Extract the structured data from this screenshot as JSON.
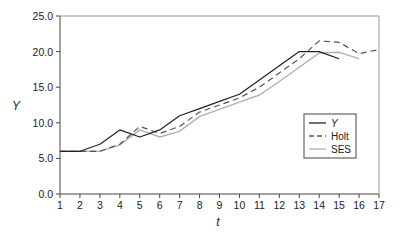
{
  "chart_data": {
    "type": "line",
    "title": "",
    "xlabel": "t",
    "ylabel": "Y",
    "xlim": [
      1,
      17
    ],
    "ylim": [
      0,
      25
    ],
    "x_ticks": [
      1,
      2,
      3,
      4,
      5,
      6,
      7,
      8,
      9,
      10,
      11,
      12,
      13,
      14,
      15,
      16,
      17
    ],
    "y_ticks": [
      "0.0",
      "5.0",
      "10.0",
      "15.0",
      "20.0",
      "25.0"
    ],
    "grid": false,
    "legend_position": "center-right",
    "series": [
      {
        "name": "Y",
        "style": "solid",
        "color": "#222222",
        "x": [
          1,
          2,
          3,
          4,
          5,
          6,
          7,
          8,
          9,
          10,
          11,
          12,
          13,
          14,
          15
        ],
        "values": [
          6,
          6,
          7,
          9,
          8,
          9,
          11,
          12,
          13,
          14,
          16,
          18,
          20,
          20,
          19
        ]
      },
      {
        "name": "Holt",
        "style": "dashed",
        "color": "#555555",
        "x": [
          1,
          2,
          3,
          4,
          5,
          6,
          7,
          8,
          9,
          10,
          11,
          12,
          13,
          14,
          15,
          16,
          17
        ],
        "values": [
          6,
          6,
          6,
          7,
          9.5,
          8.5,
          9.5,
          11.5,
          12.5,
          13.5,
          15,
          17,
          19,
          21.5,
          21.3,
          19.7,
          20.3
        ]
      },
      {
        "name": "SES",
        "style": "solid",
        "color": "#b0b0b0",
        "x": [
          1,
          2,
          3,
          4,
          5,
          6,
          7,
          8,
          9,
          10,
          11,
          12,
          13,
          14,
          15,
          16
        ],
        "values": [
          6,
          6,
          6,
          6.9,
          9,
          8,
          8.8,
          10.9,
          11.9,
          12.9,
          13.9,
          15.8,
          17.8,
          19.8,
          19.9,
          19
        ]
      }
    ]
  }
}
